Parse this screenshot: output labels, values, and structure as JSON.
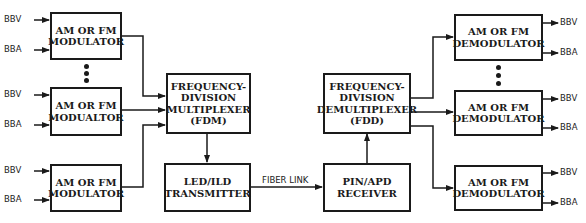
{
  "diagram": {
    "type": "block-diagram",
    "colors": {
      "line": "#1a1a1a",
      "background": "#ffffff"
    },
    "modulators": [
      {
        "line1": "AM OR FM",
        "line2": "MODULATOR",
        "inputs": [
          "BBV",
          "BBA"
        ]
      },
      {
        "line1": "AM OR FM",
        "line2": "MODUALTOR",
        "inputs": [
          "BBV",
          "BBA"
        ]
      },
      {
        "line1": "AM OR FM",
        "line2": "MODULATOR",
        "inputs": [
          "BBV",
          "BBA"
        ]
      }
    ],
    "multiplexer": {
      "lines": [
        "FREQUENCY-",
        "DIVISION",
        "MULTIPLEXER",
        "(FDM)"
      ]
    },
    "transmitter": {
      "lines": [
        "LED/ILD",
        "TRANSMITTER"
      ]
    },
    "link_label": "FIBER LINK",
    "receiver": {
      "lines": [
        "PIN/APD",
        "RECEIVER"
      ]
    },
    "demultiplexer": {
      "lines": [
        "FREQUENCY-",
        "DIVISION",
        "DEMULTIPLEXER",
        "(FDD)"
      ]
    },
    "demodulators": [
      {
        "line1": "AM OR FM",
        "line2": "DEMODULATOR",
        "outputs": [
          "BBV",
          "BBA"
        ]
      },
      {
        "line1": "AM OR FM",
        "line2": "DEMODULATOR",
        "outputs": [
          "BBV",
          "BBA"
        ]
      },
      {
        "line1": "AM OR FM",
        "line2": "DEMODULATOR",
        "outputs": [
          "BBV",
          "BBA"
        ]
      }
    ]
  }
}
